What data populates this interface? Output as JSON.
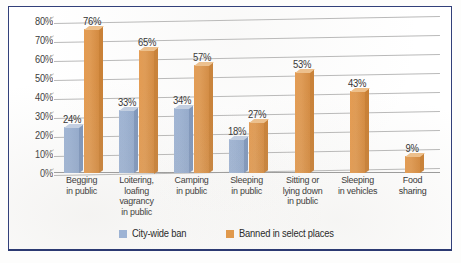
{
  "chart_data": {
    "type": "bar",
    "title": "",
    "subtitle": "",
    "xlabel": "",
    "ylabel": "",
    "ylim": [
      0,
      80
    ],
    "ytick_labels": [
      "80%",
      "70%",
      "60%",
      "50%",
      "40%",
      "30%",
      "20%",
      "10%",
      "0%"
    ],
    "ytick_values": [
      80,
      70,
      60,
      50,
      40,
      30,
      20,
      10,
      0
    ],
    "grid": true,
    "legend_position": "bottom",
    "categories": [
      "Begging\nin public",
      "Loitering,\nloafing\nvagrancy\nin public",
      "Camping\nin public",
      "Sleeping\nin public",
      "Sitting or\nlying down\nin public",
      "Sleeping\nin vehicles",
      "Food\nsharing"
    ],
    "series": [
      {
        "name": "City-wide ban",
        "color": "#9db3d4",
        "values": [
          24,
          33,
          34,
          18,
          null,
          null,
          null
        ],
        "labels": [
          "24%",
          "33%",
          "34%",
          "18%",
          "",
          "",
          ""
        ]
      },
      {
        "name": "Banned in select places",
        "color": "#e0994c",
        "values": [
          76,
          65,
          57,
          27,
          53,
          43,
          9
        ],
        "labels": [
          "76%",
          "65%",
          "57%",
          "27%",
          "53%",
          "43%",
          "9%"
        ]
      }
    ]
  },
  "axis": {
    "y_ticks": [
      {
        "label": "80%"
      },
      {
        "label": "70%"
      },
      {
        "label": "60%"
      },
      {
        "label": "50%"
      },
      {
        "label": "40%"
      },
      {
        "label": "30%"
      },
      {
        "label": "20%"
      },
      {
        "label": "10%"
      },
      {
        "label": "0%"
      }
    ],
    "x_categories": [
      {
        "lines": [
          "Begging",
          "in public"
        ]
      },
      {
        "lines": [
          "Loitering,",
          "loafing",
          "vagrancy",
          "in public"
        ]
      },
      {
        "lines": [
          "Camping",
          "in public"
        ]
      },
      {
        "lines": [
          "Sleeping",
          "in public"
        ]
      },
      {
        "lines": [
          "Sitting or",
          "lying down",
          "in public"
        ]
      },
      {
        "lines": [
          "Sleeping",
          "in vehicles"
        ]
      },
      {
        "lines": [
          "Food",
          "sharing"
        ]
      }
    ]
  },
  "groups": [
    {
      "name": "begging-in-public",
      "bars": [
        {
          "series": "City-wide ban",
          "value": 24,
          "label": "24%",
          "color": "blue"
        },
        {
          "series": "Banned in select places",
          "value": 76,
          "label": "76%",
          "color": "orange"
        }
      ],
      "cat_lines": [
        "Begging",
        "in public"
      ]
    },
    {
      "name": "loitering-loafing-vagrancy-in-public",
      "bars": [
        {
          "series": "City-wide ban",
          "value": 33,
          "label": "33%",
          "color": "blue"
        },
        {
          "series": "Banned in select places",
          "value": 65,
          "label": "65%",
          "color": "orange"
        }
      ],
      "cat_lines": [
        "Loitering,",
        "loafing",
        "vagrancy",
        "in public"
      ]
    },
    {
      "name": "camping-in-public",
      "bars": [
        {
          "series": "City-wide ban",
          "value": 34,
          "label": "34%",
          "color": "blue"
        },
        {
          "series": "Banned in select places",
          "value": 57,
          "label": "57%",
          "color": "orange"
        }
      ],
      "cat_lines": [
        "Camping",
        "in public"
      ]
    },
    {
      "name": "sleeping-in-public",
      "bars": [
        {
          "series": "City-wide ban",
          "value": 18,
          "label": "18%",
          "color": "blue"
        },
        {
          "series": "Banned in select places",
          "value": 27,
          "label": "27%",
          "color": "orange"
        }
      ],
      "cat_lines": [
        "Sleeping",
        "in public"
      ]
    },
    {
      "name": "sitting-or-lying-down-in-public",
      "bars": [
        {
          "series": "Banned in select places",
          "value": 53,
          "label": "53%",
          "color": "orange"
        }
      ],
      "cat_lines": [
        "Sitting or",
        "lying down",
        "in public"
      ]
    },
    {
      "name": "sleeping-in-vehicles",
      "bars": [
        {
          "series": "Banned in select places",
          "value": 43,
          "label": "43%",
          "color": "orange"
        }
      ],
      "cat_lines": [
        "Sleeping",
        "in vehicles"
      ]
    },
    {
      "name": "food-sharing",
      "bars": [
        {
          "series": "Banned in select places",
          "value": 9,
          "label": "9%",
          "color": "orange"
        }
      ],
      "cat_lines": [
        "Food",
        "sharing"
      ]
    }
  ],
  "legend": {
    "items": [
      {
        "label": "City-wide ban",
        "color": "#9db3d4",
        "swatch": "blue"
      },
      {
        "label": "Banned in select places",
        "color": "#e0994c",
        "swatch": "orange"
      }
    ]
  },
  "colors": {
    "series_city_wide_ban": "#9db3d4",
    "series_banned_select": "#e0994c",
    "frame_border": "#32407a",
    "gridline": "#b9b9b9",
    "text": "#2e2e2e",
    "background": "#ffffff"
  }
}
